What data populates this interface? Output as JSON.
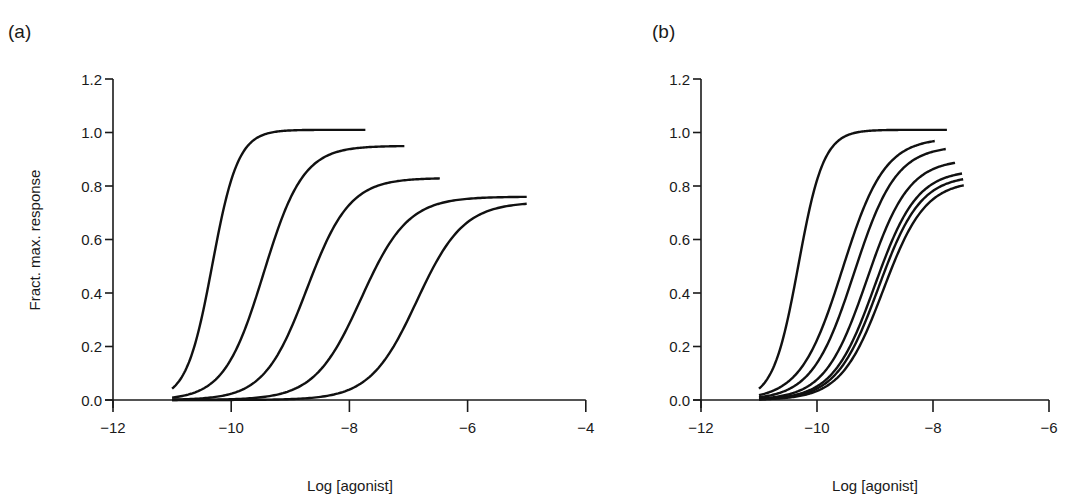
{
  "figure": {
    "panels": [
      {
        "label": "(a)",
        "xlabel": "Log [agonist]",
        "ylabel": "Fract. max. response",
        "xticks": [
          "−12",
          "−10",
          "−8",
          "−6",
          "−4"
        ],
        "yticks": [
          "0.0",
          "0.2",
          "0.4",
          "0.6",
          "0.8",
          "1.0",
          "1.2"
        ]
      },
      {
        "label": "(b)",
        "xlabel": "Log [agonist]",
        "ylabel": "",
        "xticks": [
          "−12",
          "−10",
          "−8",
          "−6"
        ],
        "yticks": [
          "0.0",
          "0.2",
          "0.4",
          "0.6",
          "0.8",
          "1.0",
          "1.2"
        ]
      }
    ]
  },
  "chart_data": [
    {
      "type": "line",
      "title": "(a)",
      "xlabel": "Log [agonist]",
      "ylabel": "Fract. max. response",
      "xlim": [
        -12,
        -4
      ],
      "ylim": [
        0,
        1.2
      ],
      "xtick_values": [
        -12,
        -10,
        -8,
        -6,
        -4
      ],
      "ytick_values": [
        0,
        0.2,
        0.4,
        0.6,
        0.8,
        1.0,
        1.2
      ],
      "grid": false,
      "legend": null,
      "curve_model": "Emax / (1 + 10^(n*(logEC50 - x)))",
      "series": [
        {
          "name": "curve 1",
          "emax": 1.01,
          "logEC50": -10.32,
          "n": 2.0,
          "x_start": -11.0,
          "x_end": -7.73
        },
        {
          "name": "curve 2",
          "emax": 0.95,
          "logEC50": -9.45,
          "n": 1.3,
          "x_start": -11.0,
          "x_end": -7.07
        },
        {
          "name": "curve 3",
          "emax": 0.83,
          "logEC50": -8.72,
          "n": 1.2,
          "x_start": -11.0,
          "x_end": -6.47
        },
        {
          "name": "curve 4",
          "emax": 0.76,
          "logEC50": -7.8,
          "n": 1.1,
          "x_start": -11.0,
          "x_end": -5.0
        },
        {
          "name": "curve 5",
          "emax": 0.74,
          "logEC50": -6.86,
          "n": 1.1,
          "x_start": -11.0,
          "x_end": -5.0
        }
      ]
    },
    {
      "type": "line",
      "title": "(b)",
      "xlabel": "Log [agonist]",
      "ylabel": "",
      "xlim": [
        -12,
        -6
      ],
      "ylim": [
        0,
        1.2
      ],
      "xtick_values": [
        -12,
        -10,
        -8,
        -6
      ],
      "ytick_values": [
        0,
        0.2,
        0.4,
        0.6,
        0.8,
        1.0,
        1.2
      ],
      "grid": false,
      "legend": null,
      "curve_model": "Emax / (1 + 10^(n*(logEC50 - x)))",
      "series": [
        {
          "name": "curve 1",
          "emax": 1.01,
          "logEC50": -10.32,
          "n": 2.0,
          "x_start": -11.0,
          "x_end": -7.76
        },
        {
          "name": "curve 2",
          "emax": 0.98,
          "logEC50": -9.56,
          "n": 1.2,
          "x_start": -11.0,
          "x_end": -7.97
        },
        {
          "name": "curve 3",
          "emax": 0.95,
          "logEC50": -9.36,
          "n": 1.2,
          "x_start": -11.0,
          "x_end": -7.78
        },
        {
          "name": "curve 4",
          "emax": 0.9,
          "logEC50": -9.14,
          "n": 1.2,
          "x_start": -11.0,
          "x_end": -7.62
        },
        {
          "name": "curve 5",
          "emax": 0.86,
          "logEC50": -9.0,
          "n": 1.2,
          "x_start": -11.0,
          "x_end": -7.5
        },
        {
          "name": "curve 6",
          "emax": 0.84,
          "logEC50": -8.94,
          "n": 1.2,
          "x_start": -11.0,
          "x_end": -7.48
        },
        {
          "name": "curve 7",
          "emax": 0.82,
          "logEC50": -8.86,
          "n": 1.2,
          "x_start": -11.0,
          "x_end": -7.47
        }
      ]
    }
  ]
}
